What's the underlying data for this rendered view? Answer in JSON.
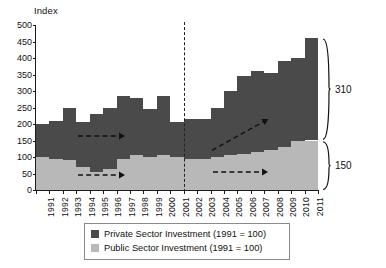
{
  "chart_data": {
    "type": "bar",
    "title": "",
    "subtitle": "",
    "ylabel": "Index",
    "xlabel": "",
    "ylim": [
      0,
      500
    ],
    "ytick_step": 50,
    "yticks": [
      "0",
      "50",
      "100",
      "150",
      "200",
      "250",
      "300",
      "350",
      "400",
      "450",
      "500"
    ],
    "grid": false,
    "stacked": true,
    "legend_position": "bottom",
    "categories": [
      "1991",
      "1992",
      "1993",
      "1994",
      "1995",
      "1996",
      "1997",
      "1998",
      "1999",
      "2000",
      "2001",
      "2002",
      "2003",
      "2004",
      "2005",
      "2006",
      "2007",
      "2008",
      "2009",
      "2010",
      "2011"
    ],
    "series": [
      {
        "name": "Private Sector Investment (1991 = 100)",
        "color": "#4a4a4a",
        "values": [
          100,
          115,
          160,
          135,
          175,
          185,
          190,
          175,
          145,
          180,
          105,
          120,
          120,
          150,
          195,
          235,
          245,
          235,
          260,
          250,
          310
        ]
      },
      {
        "name": "Public Sector Investment (1991 = 100)",
        "color": "#b8b8b8",
        "values": [
          100,
          95,
          90,
          70,
          55,
          65,
          95,
          105,
          100,
          105,
          100,
          95,
          95,
          100,
          105,
          110,
          115,
          120,
          130,
          150,
          150
        ]
      }
    ],
    "totals": [
      200,
      210,
      250,
      205,
      230,
      250,
      285,
      280,
      245,
      285,
      205,
      215,
      215,
      250,
      300,
      345,
      360,
      355,
      390,
      400,
      460
    ],
    "annotations": [
      {
        "name": "brace-private",
        "label": "310",
        "value": 310,
        "target_series": "Private Sector Investment (1991 = 100)",
        "span": [
          150,
          460
        ]
      },
      {
        "name": "brace-public",
        "label": "150",
        "value": 150,
        "target_series": "Public Sector Investment (1991 = 100)",
        "span": [
          0,
          150
        ]
      },
      {
        "name": "divider-line",
        "label": "",
        "style": "vertical-dashed",
        "between": [
          "2001",
          "2002"
        ]
      },
      {
        "name": "trend-arrow-private-left",
        "label": "",
        "style": "dashed-arrow-horizontal"
      },
      {
        "name": "trend-arrow-public-left",
        "label": "",
        "style": "dashed-arrow-horizontal"
      },
      {
        "name": "trend-arrow-private-right",
        "label": "",
        "style": "dashed-arrow-rising"
      },
      {
        "name": "trend-arrow-public-right",
        "label": "",
        "style": "dashed-arrow-horizontal"
      }
    ]
  },
  "legend": {
    "items": [
      {
        "label": "Private Sector Investment (1991 = 100)",
        "swatch": "private"
      },
      {
        "label": "Public Sector Investment (1991 = 100)",
        "swatch": "public"
      }
    ]
  },
  "colors": {
    "private": "#4a4a4a",
    "public": "#b8b8b8",
    "axis": "#1a1a1a",
    "background": "#ffffff"
  }
}
